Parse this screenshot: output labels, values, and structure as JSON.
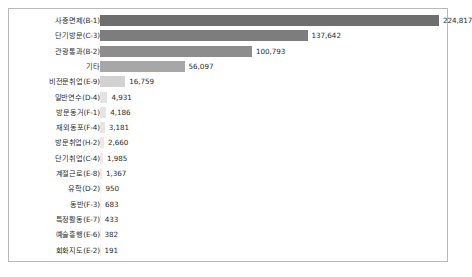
{
  "chart_data": {
    "type": "bar",
    "orientation": "horizontal",
    "title": "",
    "subtitle": "",
    "xlabel": "",
    "ylabel": "",
    "grid": false,
    "legend": null,
    "xlim": [
      0,
      224817
    ],
    "categories": [
      "사증면제(B-1)",
      "단기방문(C-3)",
      "관광통과(B-2)",
      "기타",
      "비전문취업(E-9)",
      "일반연수(D-4)",
      "방문동거(F-1)",
      "재외동포(F-4)",
      "방문취업(H-2)",
      "단기취업(C-4)",
      "계절근로(E-8)",
      "유학(D-2)",
      "동반(F-3)",
      "특정활동(E-7)",
      "예술흥행(E-6)",
      "회화지도(E-2)"
    ],
    "values": [
      224817,
      137642,
      100793,
      56097,
      16759,
      4931,
      4186,
      3181,
      2660,
      1985,
      1367,
      950,
      683,
      433,
      382,
      191
    ],
    "value_labels": [
      "224,817",
      "137,642",
      "100,793",
      "56,097",
      "16,759",
      "4,931",
      "4,186",
      "3,181",
      "2,660",
      "1,985",
      "1,367",
      "950",
      "683",
      "433",
      "382",
      "191"
    ],
    "bar_colors": [
      "#6e6e6e",
      "#7d7d7d",
      "#8d8d8d",
      "#a7a7a7",
      "#d2d2d2",
      "#e2e2e2",
      "#e4e4e4",
      "#e6e6e6",
      "#e8e8e8",
      "#eaeaea",
      "#ececec",
      "#ededed",
      "#eeeeee",
      "#efefef",
      "#efefef",
      "#f0f0f0"
    ]
  },
  "frame": {
    "border_color": "#b9b9b9",
    "background": "#ffffff"
  }
}
